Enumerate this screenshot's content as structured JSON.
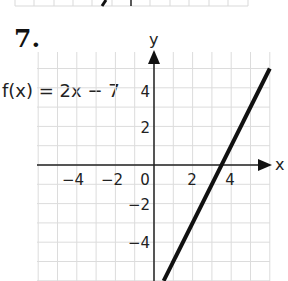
{
  "problem": {
    "number": "7.",
    "function_label": "f(x) = 2x − 7"
  },
  "axes": {
    "x_label": "x",
    "y_label": "y",
    "x_ticks": [
      "−4",
      "−2",
      "0",
      "2",
      "4"
    ],
    "y_ticks": [
      "4",
      "2",
      "−2",
      "−4"
    ]
  },
  "colors": {
    "line": "#111111",
    "grid": "#d9d9d9",
    "axis": "#222222"
  },
  "chart_data": {
    "type": "line",
    "title": "f(x) = 2x − 7",
    "xlabel": "x",
    "ylabel": "y",
    "xlim": [
      -6,
      6
    ],
    "ylim": [
      -6,
      6
    ],
    "grid": true,
    "x_tick_labels": [
      -4,
      -2,
      0,
      2,
      4
    ],
    "y_tick_labels": [
      -4,
      -2,
      2,
      4
    ],
    "series": [
      {
        "name": "f(x) = 2x - 7",
        "x": [
          0.5,
          6
        ],
        "y": [
          -6,
          5
        ]
      }
    ],
    "x_intercept": 3.5
  }
}
